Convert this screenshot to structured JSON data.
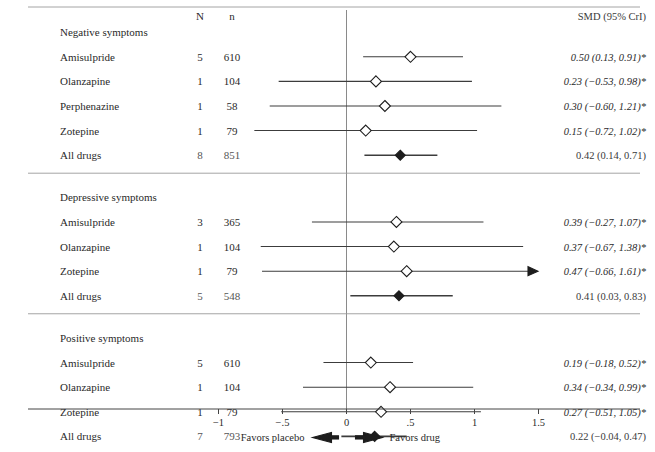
{
  "figure": {
    "title": "",
    "columns": {
      "study": "",
      "n_studies": "N",
      "n_patients": "n",
      "estimate": "SMD (95% CrI)"
    },
    "footer": {
      "favors_left": "Favors placebo",
      "favors_right": "Favors drug"
    }
  },
  "chart_data": {
    "type": "forest",
    "title": "",
    "xlabel": "",
    "ylabel": "",
    "xlim": [
      -1.35,
      1.72
    ],
    "grid": false,
    "legend": null,
    "zero_reference": 0,
    "effect_measure": "SMD (95% CrI)",
    "axis": {
      "ticks": [
        -1,
        -0.5,
        0,
        0.5,
        1,
        1.5
      ],
      "tick_labels": [
        "−1",
        "−.5",
        "0",
        ".5",
        "1",
        "1.5"
      ]
    },
    "annotations": {
      "favors_left": "Favors placebo",
      "favors_right": "Favors drug",
      "significance_marker": "*"
    },
    "groups": [
      {
        "name": "Negative symptoms",
        "rows": [
          {
            "label": "Amisulpride",
            "N": "5",
            "n": "610",
            "estimate": 0.5,
            "lower": 0.13,
            "upper": 0.91,
            "text": "0.50 (0.13, 0.91)*",
            "pooled": false,
            "clipped_left": false,
            "clipped_right": false
          },
          {
            "label": "Olanzapine",
            "N": "1",
            "n": "104",
            "estimate": 0.23,
            "lower": -0.53,
            "upper": 0.98,
            "text": "0.23 (−0.53, 0.98)*",
            "pooled": false,
            "clipped_left": false,
            "clipped_right": false
          },
          {
            "label": "Perphenazine",
            "N": "1",
            "n": "58",
            "estimate": 0.3,
            "lower": -0.6,
            "upper": 1.21,
            "text": "0.30 (−0.60, 1.21)*",
            "pooled": false,
            "clipped_left": false,
            "clipped_right": false
          },
          {
            "label": "Zotepine",
            "N": "1",
            "n": "79",
            "estimate": 0.15,
            "lower": -0.72,
            "upper": 1.02,
            "text": "0.15 (−0.72, 1.02)*",
            "pooled": false,
            "clipped_left": false,
            "clipped_right": false
          },
          {
            "label": "All drugs",
            "N": "8",
            "n": "851",
            "estimate": 0.42,
            "lower": 0.14,
            "upper": 0.71,
            "text": "0.42 (0.14, 0.71)",
            "pooled": true,
            "clipped_left": false,
            "clipped_right": false
          }
        ]
      },
      {
        "name": "Depressive symptoms",
        "rows": [
          {
            "label": "Amisulpride",
            "N": "3",
            "n": "365",
            "estimate": 0.39,
            "lower": -0.27,
            "upper": 1.07,
            "text": "0.39 (−0.27, 1.07)*",
            "pooled": false,
            "clipped_left": false,
            "clipped_right": false
          },
          {
            "label": "Olanzapine",
            "N": "1",
            "n": "104",
            "estimate": 0.37,
            "lower": -0.67,
            "upper": 1.38,
            "text": "0.37 (−0.67, 1.38)*",
            "pooled": false,
            "clipped_left": false,
            "clipped_right": false
          },
          {
            "label": "Zotepine",
            "N": "1",
            "n": "79",
            "estimate": 0.47,
            "lower": -0.66,
            "upper": 1.61,
            "text": "0.47 (−0.66, 1.61)*",
            "pooled": false,
            "clipped_left": false,
            "clipped_right": true
          },
          {
            "label": "All drugs",
            "N": "5",
            "n": "548",
            "estimate": 0.41,
            "lower": 0.03,
            "upper": 0.83,
            "text": "0.41 (0.03, 0.83)",
            "pooled": true,
            "clipped_left": false,
            "clipped_right": false
          }
        ]
      },
      {
        "name": "Positive symptoms",
        "rows": [
          {
            "label": "Amisulpride",
            "N": "5",
            "n": "610",
            "estimate": 0.19,
            "lower": -0.18,
            "upper": 0.52,
            "text": "0.19 (−0.18, 0.52)*",
            "pooled": false,
            "clipped_left": false,
            "clipped_right": false
          },
          {
            "label": "Olanzapine",
            "N": "1",
            "n": "104",
            "estimate": 0.34,
            "lower": -0.34,
            "upper": 0.99,
            "text": "0.34 (−0.34, 0.99)*",
            "pooled": false,
            "clipped_left": false,
            "clipped_right": false
          },
          {
            "label": "Zotepine",
            "N": "1",
            "n": "79",
            "estimate": 0.27,
            "lower": -0.51,
            "upper": 1.05,
            "text": "0.27 (−0.51, 1.05)*",
            "pooled": false,
            "clipped_left": false,
            "clipped_right": false
          },
          {
            "label": "All drugs",
            "N": "7",
            "n": "793",
            "estimate": 0.22,
            "lower": -0.04,
            "upper": 0.47,
            "text": "0.22 (−0.04, 0.47)",
            "pooled": true,
            "clipped_left": false,
            "clipped_right": false
          }
        ]
      }
    ]
  }
}
